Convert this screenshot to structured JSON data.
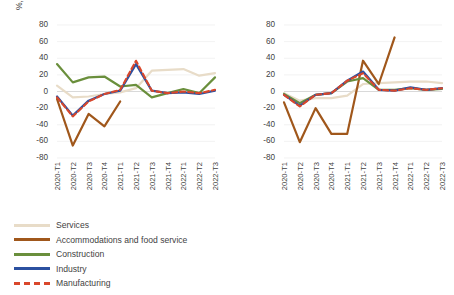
{
  "figure": {
    "panels": [
      "left",
      "right"
    ]
  },
  "colors": {
    "services": "#E8DCC8",
    "accommodations": "#A0571B",
    "construction": "#6A8F3C",
    "industry": "#2B50A0",
    "manufacturing": "#D9472B",
    "axis_text": "#3f3f3f",
    "gridline": "#EDEDED",
    "zero_line": "#D9D9D9"
  },
  "legend": {
    "items": [
      {
        "label": "Services",
        "color_key": "services",
        "dashed": false
      },
      {
        "label": "Accommodations and food service",
        "color_key": "accommodations",
        "dashed": false
      },
      {
        "label": "Construction",
        "color_key": "construction",
        "dashed": false
      },
      {
        "label": "Industry",
        "color_key": "industry",
        "dashed": false
      },
      {
        "label": "Manufacturing",
        "color_key": "manufacturing",
        "dashed": true
      }
    ]
  },
  "chart_data": [
    {
      "type": "line",
      "panel": "left",
      "title": "",
      "xlabel": "",
      "ylabel": "%, year on year",
      "ylim": [
        -80,
        80
      ],
      "yticks": [
        80,
        60,
        40,
        20,
        0,
        -20,
        -40,
        -60,
        -80
      ],
      "grid": true,
      "legend_position": "bottom-left",
      "categories": [
        "2020-T1",
        "2020-T2",
        "2020-T3",
        "2020-T4",
        "2021-T1",
        "2021-T2",
        "2021-T3",
        "2021-T4",
        "2022-T1",
        "2022-T2",
        "2022-T3"
      ],
      "series": [
        {
          "name": "Services",
          "values": [
            7,
            -7,
            -6,
            -3,
            -1,
            4,
            25,
            26,
            27,
            19,
            22
          ]
        },
        {
          "name": "Accommodations and food service",
          "values": [
            -9,
            -65,
            -27,
            -42,
            -12,
            null,
            null,
            null,
            null,
            null,
            null
          ]
        },
        {
          "name": "Construction",
          "values": [
            33,
            11,
            17,
            18,
            6,
            8,
            -7,
            -2,
            3,
            -2,
            17
          ]
        },
        {
          "name": "Industry",
          "values": [
            -6,
            -29,
            -11,
            -3,
            1,
            33,
            1,
            -2,
            -1,
            -3,
            1
          ]
        },
        {
          "name": "Manufacturing",
          "values": [
            -7,
            -30,
            -12,
            -3,
            2,
            37,
            1,
            -2,
            0,
            -2,
            2
          ]
        }
      ]
    },
    {
      "type": "line",
      "panel": "right",
      "title": "",
      "xlabel": "",
      "ylabel": "%, year on year",
      "ylim": [
        -80,
        80
      ],
      "yticks": [
        80,
        60,
        40,
        20,
        0,
        -20,
        -40,
        -60,
        -80
      ],
      "grid": true,
      "legend_position": "bottom-left",
      "categories": [
        "2020-T1",
        "2020-T2",
        "2020-T3",
        "2020-T4",
        "2021-T1",
        "2021-T2",
        "2021-T3",
        "2021-T4",
        "2022-T1",
        "2022-T2",
        "2022-T3"
      ],
      "series": [
        {
          "name": "Services",
          "values": [
            -2,
            -11,
            -8,
            -8,
            -5,
            9,
            10,
            11,
            12,
            12,
            10
          ]
        },
        {
          "name": "Accommodations and food service",
          "values": [
            -13,
            -61,
            -20,
            -51,
            -51,
            37,
            9,
            65,
            null,
            null,
            null
          ]
        },
        {
          "name": "Construction",
          "values": [
            -3,
            -14,
            -4,
            -2,
            12,
            16,
            2,
            2,
            4,
            2,
            3
          ]
        },
        {
          "name": "Industry",
          "values": [
            -4,
            -17,
            -4,
            -2,
            13,
            24,
            2,
            1,
            5,
            2,
            4
          ]
        },
        {
          "name": "Manufacturing",
          "values": [
            -4,
            -18,
            -4,
            -2,
            13,
            22,
            2,
            1,
            4,
            2,
            4
          ]
        }
      ]
    }
  ]
}
